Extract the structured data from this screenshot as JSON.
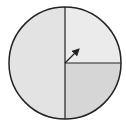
{
  "diagram": {
    "type": "spinner",
    "sections": [
      {
        "name": "left-half",
        "fraction": 0.5,
        "color": "#e3e3e3"
      },
      {
        "name": "upper-right-quarter",
        "fraction": 0.25,
        "color": "#ebebeb"
      },
      {
        "name": "lower-right-quarter",
        "fraction": 0.25,
        "color": "#d6d6d6"
      }
    ],
    "outline_color": "#222222",
    "arrow": {
      "direction": "up-right",
      "color": "#222222"
    }
  }
}
